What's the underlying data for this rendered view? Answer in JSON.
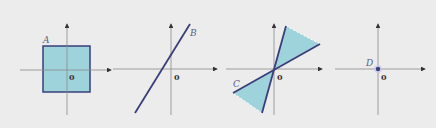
{
  "figure": {
    "panels": [
      {
        "id": "A",
        "label": "A",
        "origin_label": "0",
        "shape": "square",
        "description": "Filled square region centered near origin"
      },
      {
        "id": "B",
        "label": "B",
        "origin_label": "0",
        "shape": "line",
        "description": "Line not passing through origin"
      },
      {
        "id": "C",
        "label": "C",
        "origin_label": "0",
        "shape": "double-cone",
        "description": "Double cone region between two lines through origin"
      },
      {
        "id": "D",
        "label": "D",
        "origin_label": "0",
        "shape": "point",
        "description": "Single point at origin"
      }
    ],
    "colors": {
      "background": "#ececec",
      "fill": "#9ed3dc",
      "stroke": "#3a3f7a",
      "axis": "#8a8a8a"
    }
  }
}
